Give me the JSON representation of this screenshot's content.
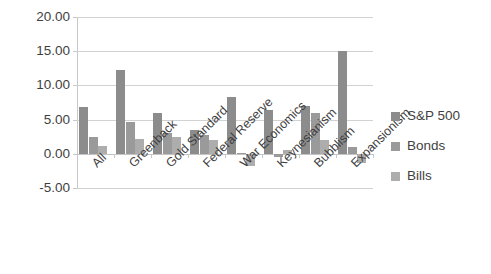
{
  "chart_data": {
    "type": "bar",
    "title": "",
    "subtitle": "",
    "xlabel": "",
    "ylabel": "",
    "ylim": [
      -5.0,
      20.0
    ],
    "ytick_step": 5.0,
    "ytick_labels": [
      "20.00",
      "15.00",
      "10.00",
      "5.00",
      "0.00",
      "-5.00"
    ],
    "ytick_values": [
      20.0,
      15.0,
      10.0,
      5.0,
      0.0,
      -5.0
    ],
    "grid": true,
    "grid_axis": "y",
    "legend_position": "right",
    "categories": [
      "All",
      "Greenback",
      "Gold Standard",
      "Federal Reserve",
      "War Economics",
      "Keynesianism",
      "Bubblism",
      "Expansionism"
    ],
    "series": [
      {
        "name": "S&P 500",
        "color": "#8c8c8c",
        "values": [
          6.8,
          12.2,
          6.0,
          3.5,
          8.3,
          6.4,
          7.0,
          15.0
        ]
      },
      {
        "name": "Bonds",
        "color": "#9a9a9a",
        "values": [
          2.4,
          4.7,
          3.0,
          2.8,
          0.1,
          -0.4,
          6.0,
          1.0
        ]
      },
      {
        "name": "Bills",
        "color": "#adadad",
        "values": [
          1.1,
          2.1,
          2.5,
          2.0,
          -1.8,
          0.6,
          2.0,
          -1.3
        ]
      }
    ],
    "colors": {
      "series_1": "#8c8c8c",
      "series_2": "#9a9a9a",
      "series_3": "#adadad",
      "gridline": "#d2d2d2",
      "axis": "#c8c8c8",
      "text": "#3f3f3f",
      "background": "#ffffff"
    }
  },
  "legend": {
    "items": [
      {
        "label": "S&P 500"
      },
      {
        "label": "Bonds"
      },
      {
        "label": "Bills"
      }
    ]
  }
}
